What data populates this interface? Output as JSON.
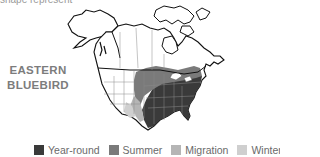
{
  "caption": "shape represent",
  "map": {
    "title_line1": "EASTERN",
    "title_line2": "BLUEBIRD",
    "region": "North America"
  },
  "legend": {
    "items": [
      {
        "label": "Year-round",
        "color": "#3a3a3a"
      },
      {
        "label": "Summer",
        "color": "#7a7a7a"
      },
      {
        "label": "Migration",
        "color": "#b5b5b5"
      },
      {
        "label": "Winter",
        "color": "#cfcfcf"
      }
    ]
  },
  "colors": {
    "year_round": "#3a3a3a",
    "summer": "#7a7a7a",
    "migration": "#b5b5b5",
    "winter": "#cfcfcf",
    "outline": "#111111",
    "borders": "#8a8a8a"
  }
}
